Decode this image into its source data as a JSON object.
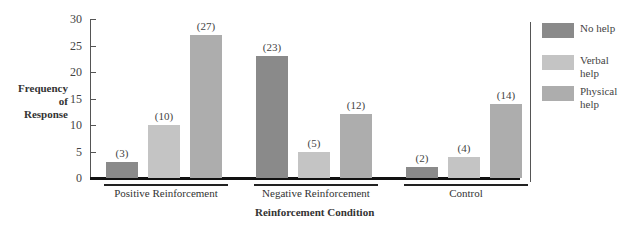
{
  "chart_data": {
    "type": "bar",
    "title": "",
    "xlabel": "Reinforcement Condition",
    "ylabel": "Frequency of Response",
    "ylabel_lines": [
      "Frequency",
      "of",
      "Response"
    ],
    "ylim": [
      0,
      30
    ],
    "yticks": [
      0,
      5,
      10,
      15,
      20,
      25,
      30
    ],
    "grid": false,
    "legend_position": "right",
    "categories": [
      "Positive Reinforcement",
      "Negative Reinforcement",
      "Control"
    ],
    "series": [
      {
        "name": "No help",
        "color": "#8a8a8a",
        "values": [
          3,
          23,
          2
        ]
      },
      {
        "name": "Verbal help",
        "color": "#c4c4c4",
        "values": [
          10,
          5,
          4
        ]
      },
      {
        "name": "Physical help",
        "color": "#adadad",
        "values": [
          27,
          12,
          14
        ]
      }
    ],
    "data_labels": [
      [
        "(3)",
        "(10)",
        "(27)"
      ],
      [
        "(23)",
        "(5)",
        "(12)"
      ],
      [
        "(2)",
        "(4)",
        "(14)"
      ]
    ]
  },
  "legend": {
    "items": [
      {
        "label_lines": [
          "No help"
        ]
      },
      {
        "label_lines": [
          "Verbal",
          "help"
        ]
      },
      {
        "label_lines": [
          "Physical",
          "help"
        ]
      }
    ]
  }
}
